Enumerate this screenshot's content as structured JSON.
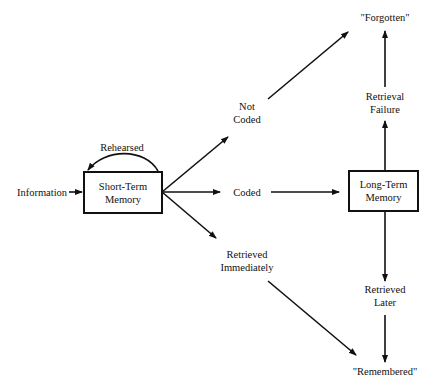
{
  "diagram": {
    "type": "flowchart",
    "topic": "memory processing model",
    "nodes": {
      "information": "Information",
      "rehearsed": "Rehearsed",
      "short_term_memory": {
        "line1": "Short-Term",
        "line2": "Memory"
      },
      "not_coded": {
        "line1": "Not",
        "line2": "Coded"
      },
      "coded": "Coded",
      "retrieved_immediately": {
        "line1": "Retrieved",
        "line2": "Immediately"
      },
      "long_term_memory": {
        "line1": "Long-Term",
        "line2": "Memory"
      },
      "retrieval_failure": {
        "line1": "Retrieval",
        "line2": "Failure"
      },
      "retrieved_later": {
        "line1": "Retrieved",
        "line2": "Later"
      },
      "forgotten": "\"Forgotten\"",
      "remembered": "\"Remembered\""
    },
    "edges": [
      {
        "from": "Information",
        "to": "Short-Term Memory"
      },
      {
        "from": "Short-Term Memory",
        "to": "Short-Term Memory",
        "label": "Rehearsed"
      },
      {
        "from": "Short-Term Memory",
        "to": "Not Coded"
      },
      {
        "from": "Short-Term Memory",
        "to": "Coded"
      },
      {
        "from": "Short-Term Memory",
        "to": "Retrieved Immediately"
      },
      {
        "from": "Not Coded",
        "to": "\"Forgotten\""
      },
      {
        "from": "Coded",
        "to": "Long-Term Memory"
      },
      {
        "from": "Retrieved Immediately",
        "to": "\"Remembered\""
      },
      {
        "from": "Long-Term Memory",
        "to": "Retrieval Failure"
      },
      {
        "from": "Retrieval Failure",
        "to": "\"Forgotten\""
      },
      {
        "from": "Long-Term Memory",
        "to": "Retrieved Later"
      },
      {
        "from": "Retrieved Later",
        "to": "\"Remembered\""
      }
    ]
  }
}
